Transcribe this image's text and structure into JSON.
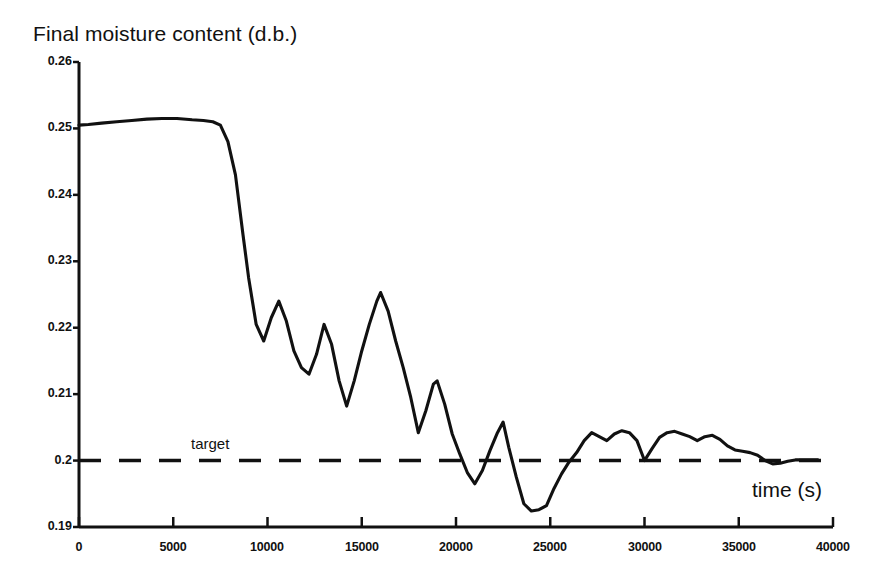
{
  "chart_data": {
    "type": "line",
    "title": "Final moisture content (d.b.)",
    "xlabel": "time (s)",
    "ylabel": "",
    "xlim": [
      0,
      40000
    ],
    "ylim": [
      0.19,
      0.26
    ],
    "grid": false,
    "legend": "none",
    "x_ticks": [
      "0",
      "5000",
      "10000",
      "15000",
      "20000",
      "25000",
      "30000",
      "35000",
      "40000"
    ],
    "x_tick_values": [
      0,
      5000,
      10000,
      15000,
      20000,
      25000,
      30000,
      35000,
      40000
    ],
    "y_ticks": [
      "0.26",
      "0.25",
      "0.24",
      "0.23",
      "0.22",
      "0.21",
      "0.2",
      "0.19"
    ],
    "y_tick_values": [
      0.26,
      0.25,
      0.24,
      0.23,
      0.22,
      0.21,
      0.2,
      0.19
    ],
    "series": [
      {
        "name": "Final moisture content",
        "style": "solid",
        "color": "#111111",
        "x": [
          0,
          500,
          1200,
          2000,
          2800,
          3600,
          4400,
          5200,
          6000,
          6600,
          7100,
          7500,
          7900,
          8300,
          8700,
          9000,
          9400,
          9800,
          10200,
          10600,
          11000,
          11400,
          11800,
          12200,
          12600,
          13000,
          13400,
          13800,
          14200,
          14600,
          15000,
          15400,
          15800,
          16000,
          16400,
          16800,
          17200,
          17600,
          18000,
          18400,
          18800,
          19000,
          19400,
          19800,
          20200,
          20600,
          21000,
          21400,
          21800,
          22200,
          22500,
          22800,
          23200,
          23600,
          24000,
          24400,
          24800,
          25200,
          25600,
          26000,
          26400,
          26800,
          27200,
          27600,
          28000,
          28400,
          28800,
          29200,
          29600,
          30000,
          30400,
          30800,
          31200,
          31600,
          32000,
          32400,
          32800,
          33200,
          33600,
          34000,
          34400,
          34800,
          35200,
          35600,
          36000,
          36400,
          36800,
          37200,
          37600,
          38000,
          38400,
          38800,
          39200
        ],
        "y": [
          0.2505,
          0.2506,
          0.2508,
          0.251,
          0.2512,
          0.2514,
          0.2515,
          0.2515,
          0.2513,
          0.2512,
          0.251,
          0.2505,
          0.248,
          0.243,
          0.234,
          0.2275,
          0.2205,
          0.218,
          0.2215,
          0.224,
          0.221,
          0.2165,
          0.214,
          0.213,
          0.216,
          0.2205,
          0.2175,
          0.212,
          0.2082,
          0.212,
          0.2165,
          0.2205,
          0.224,
          0.2253,
          0.2225,
          0.218,
          0.214,
          0.2095,
          0.2042,
          0.2075,
          0.2115,
          0.212,
          0.2085,
          0.204,
          0.201,
          0.1982,
          0.1965,
          0.1985,
          0.2015,
          0.2042,
          0.2058,
          0.202,
          0.1975,
          0.1935,
          0.1924,
          0.1926,
          0.1932,
          0.1958,
          0.198,
          0.1998,
          0.2012,
          0.203,
          0.2042,
          0.2036,
          0.203,
          0.204,
          0.2045,
          0.2042,
          0.203,
          0.2,
          0.2018,
          0.2035,
          0.2042,
          0.2044,
          0.204,
          0.2036,
          0.203,
          0.2036,
          0.2038,
          0.2032,
          0.2022,
          0.2016,
          0.2014,
          0.2012,
          0.2008,
          0.2,
          0.1995,
          0.1996,
          0.1999,
          0.2001,
          0.2001,
          0.2001,
          0.2001
        ]
      },
      {
        "name": "target",
        "style": "dashed",
        "color": "#111111",
        "constant_y": 0.2,
        "label": "target"
      }
    ]
  }
}
